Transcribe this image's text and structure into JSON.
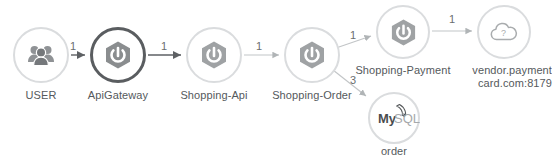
{
  "diagram": {
    "type": "service-topology",
    "colors": {
      "node_ring_default": "#d4d6d8",
      "node_ring_highlight": "#4a4a4a",
      "node_ring_mysql": "#d4d6d8",
      "icon_gray": "#8a8d8f",
      "edge_dark": "#5e6164",
      "edge_light": "#b9bcbe",
      "label_text": "#55595c",
      "background": "#ffffff"
    },
    "nodes": [
      {
        "id": "user",
        "label": "USER",
        "icon": "users-group-icon",
        "ring": "light",
        "x": 13,
        "y": 27,
        "size": 56
      },
      {
        "id": "apigateway",
        "label": "ApiGateway",
        "icon": "spring-boot-icon",
        "ring": "dark",
        "x": 90,
        "y": 27,
        "size": 56
      },
      {
        "id": "shopping-api",
        "label": "Shopping-Api",
        "icon": "spring-boot-icon",
        "ring": "light",
        "x": 186,
        "y": 27,
        "size": 56
      },
      {
        "id": "shopping-order",
        "label": "Shopping-Order",
        "icon": "spring-boot-icon",
        "ring": "light",
        "x": 284,
        "y": 27,
        "size": 56
      },
      {
        "id": "shopping-payment",
        "label": "Shopping-Payment",
        "icon": "spring-boot-icon",
        "ring": "light",
        "x": 376,
        "y": 5,
        "size": 54
      },
      {
        "id": "vendor-payment",
        "label_line1": "vendor.payment",
        "label_line2": "card.com:8179",
        "icon": "cloud-question-icon",
        "ring": "light",
        "x": 477,
        "y": 5,
        "size": 54
      },
      {
        "id": "order-mysql",
        "label": "order",
        "icon": "mysql-icon",
        "icon_text_primary": "My",
        "icon_text_secondary": "SQL",
        "ring": "light",
        "x": 368,
        "y": 92,
        "size": 52
      }
    ],
    "edges": [
      {
        "id": "user-to-apigateway",
        "label": "1",
        "weight": "dark",
        "label_x": 70,
        "label_y": 44
      },
      {
        "id": "apigateway-to-shopping-api",
        "label": "1",
        "weight": "dark",
        "label_x": 164,
        "label_y": 44
      },
      {
        "id": "shopping-api-to-shopping-order",
        "label": "1",
        "weight": "light",
        "label_x": 258,
        "label_y": 44
      },
      {
        "id": "shopping-order-to-shopping-payment",
        "label": "1",
        "weight": "light",
        "label_x": 352,
        "label_y": 33
      },
      {
        "id": "shopping-order-to-order-mysql",
        "label": "3",
        "weight": "light",
        "label_x": 352,
        "label_y": 80
      },
      {
        "id": "shopping-payment-to-vendor-payment",
        "label": "1",
        "weight": "light",
        "label_x": 450,
        "label_y": 17
      }
    ]
  }
}
